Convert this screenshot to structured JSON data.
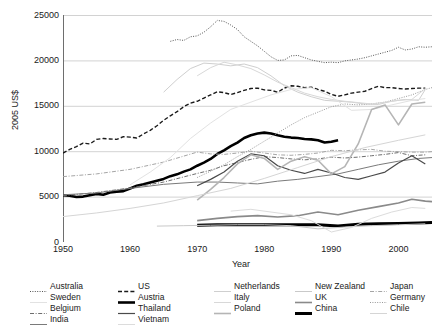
{
  "title_remnant": "",
  "axes": {
    "ylabel": "2005 US$",
    "xlabel": "Year",
    "yticks": [
      "0",
      "5000",
      "10000",
      "15000",
      "20000",
      "25000"
    ],
    "xticks": [
      "1950",
      "1960",
      "1970",
      "1980",
      "1990",
      "2000"
    ]
  },
  "legend": {
    "columns": [
      {
        "items": [
          {
            "label": "Australia",
            "style": "dotted",
            "color": "#555555",
            "width": 1
          },
          {
            "label": "Sweden",
            "style": "solid",
            "color": "#e2e2e2",
            "width": 1
          },
          {
            "label": "Belgium",
            "style": "dashdot",
            "color": "#6d6d6d",
            "width": 1
          },
          {
            "label": "India",
            "style": "solid",
            "color": "#7a7a7a",
            "width": 1
          }
        ]
      },
      {
        "items": [
          {
            "label": "US",
            "style": "dashed",
            "color": "#1a1a1a",
            "width": 1.4
          },
          {
            "label": "Austria",
            "style": "solid",
            "color": "#000000",
            "width": 2.6
          },
          {
            "label": "Thailand",
            "style": "solid",
            "color": "#4a4a4a",
            "width": 1.2
          },
          {
            "label": "Vietnam",
            "style": "solid",
            "color": "#dcdcdc",
            "width": 1
          }
        ]
      },
      {
        "items": [
          {
            "label": "Netherlands",
            "style": "solid",
            "color": "#cfcfcf",
            "width": 1
          },
          {
            "label": "Italy",
            "style": "solid",
            "color": "#d8d8d8",
            "width": 1
          },
          {
            "label": "Poland",
            "style": "solid",
            "color": "#b5b5b5",
            "width": 1.6
          }
        ]
      },
      {
        "items": [
          {
            "label": "New Zealand",
            "style": "solid",
            "color": "#c9c9c9",
            "width": 1
          },
          {
            "label": "UK",
            "style": "solid",
            "color": "#8a8a8a",
            "width": 1.6
          },
          {
            "label": "China",
            "style": "solid",
            "color": "#000000",
            "width": 3.0
          }
        ]
      },
      {
        "items": [
          {
            "label": "Japan",
            "style": "dashdot",
            "color": "#a5a5a5",
            "width": 1
          },
          {
            "label": "Germany",
            "style": "dotted",
            "color": "#999999",
            "width": 1
          },
          {
            "label": "Chile",
            "style": "solid",
            "color": "#d5d5d5",
            "width": 1
          }
        ]
      }
    ]
  },
  "chart_data": {
    "type": "line",
    "title": "",
    "xlabel": "Year",
    "ylabel": "2005 US$",
    "xlim": [
      1950,
      2005
    ],
    "ylim": [
      0,
      25000
    ],
    "grid": true,
    "legend_position": "bottom",
    "series": [
      {
        "name": "Australia",
        "style": "dotted",
        "color": "#555555",
        "width": 1,
        "x": [
          1966,
          1967,
          1968,
          1969,
          1970,
          1971,
          1972,
          1973,
          1974,
          1975,
          1976,
          1977,
          1978,
          1979,
          1980,
          1981,
          1982,
          1983,
          1984,
          1985,
          1986,
          1987,
          1988,
          1989,
          1990,
          1991,
          1992,
          1993,
          1994,
          1995,
          1996,
          1997,
          1998,
          1999,
          2000,
          2001,
          2002,
          2003,
          2004,
          2005
        ],
        "y": [
          22100,
          22300,
          22200,
          22600,
          22700,
          23100,
          23700,
          24400,
          24300,
          23900,
          23400,
          22600,
          22100,
          21600,
          21000,
          20400,
          20000,
          20050,
          20500,
          20550,
          20300,
          20050,
          19900,
          19750,
          19800,
          19750,
          19950,
          20050,
          20150,
          20300,
          20500,
          20700,
          20900,
          21100,
          21450,
          21150,
          21250,
          21500,
          21450,
          21500
        ]
      },
      {
        "name": "US",
        "style": "dashed",
        "color": "#1a1a1a",
        "width": 1.4,
        "x": [
          1950,
          1951,
          1952,
          1953,
          1954,
          1955,
          1956,
          1957,
          1958,
          1959,
          1960,
          1961,
          1962,
          1963,
          1964,
          1965,
          1966,
          1967,
          1968,
          1969,
          1970,
          1971,
          1972,
          1973,
          1974,
          1975,
          1976,
          1977,
          1978,
          1979,
          1980,
          1981,
          1982,
          1983,
          1984,
          1985,
          1986,
          1987,
          1988,
          1989,
          1990,
          1991,
          1992,
          1993,
          1994,
          1995,
          1996,
          1997,
          1998,
          1999,
          2000,
          2001,
          2002,
          2003,
          2004
        ],
        "y": [
          9800,
          10200,
          10500,
          10900,
          10800,
          11300,
          11400,
          11350,
          11300,
          11600,
          11550,
          11450,
          11900,
          12300,
          12800,
          13400,
          13900,
          14350,
          14900,
          15300,
          15500,
          15850,
          16200,
          16550,
          16450,
          16250,
          16450,
          16700,
          16900,
          16950,
          16750,
          16700,
          16500,
          16950,
          17200,
          17150,
          17000,
          17050,
          16800,
          16600,
          16250,
          16050,
          16200,
          16400,
          16500,
          16600,
          16900,
          17150,
          17000,
          17000,
          16900,
          16850,
          16900,
          16950,
          16950
        ]
      },
      {
        "name": "Austria",
        "style": "solid",
        "color": "#000000",
        "width": 2.6,
        "x": [
          1950,
          1951,
          1952,
          1953,
          1954,
          1955,
          1956,
          1957,
          1958,
          1959,
          1960,
          1961,
          1962,
          1963,
          1964,
          1965,
          1966,
          1967,
          1968,
          1969,
          1970,
          1971,
          1972,
          1973,
          1974,
          1975,
          1976,
          1977,
          1978,
          1979,
          1980,
          1981,
          1982,
          1983,
          1984,
          1985,
          1986,
          1987,
          1988,
          1989,
          1990,
          1991
        ],
        "y": [
          5150,
          5100,
          4950,
          5000,
          5150,
          5300,
          5200,
          5450,
          5550,
          5600,
          5900,
          6200,
          6350,
          6550,
          6750,
          6950,
          7250,
          7450,
          7750,
          8000,
          8400,
          8750,
          9150,
          9700,
          10100,
          10550,
          10950,
          11450,
          11750,
          11950,
          12050,
          11950,
          11750,
          11600,
          11500,
          11450,
          11350,
          11300,
          11200,
          10950,
          11050,
          11200
        ]
      },
      {
        "name": "Belgium",
        "style": "dashdot",
        "color": "#6d6d6d",
        "width": 1,
        "x": [
          1950,
          1955,
          1960,
          1965,
          1970,
          1972,
          1974,
          1976,
          1978,
          1980,
          1982,
          1984,
          1986,
          1988,
          1990,
          1992,
          1994,
          1996,
          1998,
          2000,
          2002,
          2004
        ],
        "y": [
          5100,
          5450,
          5950,
          6600,
          7550,
          7900,
          8400,
          8750,
          9100,
          9400,
          9300,
          9150,
          9050,
          9150,
          9350,
          9250,
          9350,
          9500,
          9650,
          9850,
          9500,
          9600
        ]
      },
      {
        "name": "Japan",
        "style": "dashdot",
        "color": "#a5a5a5",
        "width": 1,
        "x": [
          1950,
          1955,
          1960,
          1965,
          1970,
          1972,
          1974,
          1976,
          1978,
          1980,
          1982,
          1984,
          1986,
          1988,
          1990,
          1992,
          1994,
          1996,
          1998,
          2000,
          2002,
          2004,
          2005
        ],
        "y": [
          7200,
          7500,
          8000,
          8800,
          9900,
          9700,
          9650,
          9800,
          10000,
          9800,
          9600,
          9550,
          9650,
          9800,
          10100,
          10050,
          10150,
          10200,
          10000,
          9950,
          9900,
          9900,
          9950
        ]
      },
      {
        "name": "Germany",
        "style": "dotted",
        "color": "#999999",
        "width": 1,
        "x": [
          1970,
          1972,
          1974,
          1976,
          1978,
          1980,
          1982,
          1984,
          1986,
          1988,
          1990,
          1992,
          1994,
          1996,
          1998,
          2000,
          2002,
          2004,
          2005
        ],
        "y": [
          7100,
          7800,
          8500,
          9400,
          10200,
          11100,
          12000,
          12900,
          13700,
          14300,
          14900,
          15200,
          15100,
          15200,
          15400,
          15800,
          16200,
          16800,
          17000
        ]
      },
      {
        "name": "Netherlands",
        "style": "solid",
        "color": "#cfcfcf",
        "width": 1,
        "x": [
          1965,
          1967,
          1969,
          1971,
          1973,
          1975,
          1977,
          1979,
          1981,
          1983,
          1985,
          1987,
          1989,
          1991,
          1993,
          1995,
          1997,
          1999,
          2001,
          2003,
          2004
        ],
        "y": [
          16500,
          17900,
          19100,
          19700,
          19600,
          19400,
          19600,
          19200,
          18300,
          17200,
          16500,
          16000,
          15600,
          15500,
          15400,
          15200,
          15150,
          15500,
          15700,
          15600,
          16800
        ]
      },
      {
        "name": "Italy",
        "style": "solid",
        "color": "#d8d8d8",
        "width": 1,
        "x": [
          1970,
          1972,
          1974,
          1976,
          1978,
          1980,
          1982,
          1984,
          1986,
          1988,
          1990,
          1992,
          1994,
          1996,
          1998,
          2000,
          2002,
          2004
        ],
        "y": [
          18300,
          19200,
          19800,
          19500,
          19100,
          18400,
          17600,
          17000,
          16400,
          16000,
          15700,
          15500,
          15350,
          15200,
          15400,
          15600,
          15700,
          16900
        ]
      },
      {
        "name": "Sweden",
        "style": "solid",
        "color": "#e2e2e2",
        "width": 1,
        "x": [
          1960,
          1963,
          1966,
          1969,
          1972,
          1975,
          1978,
          1981,
          1984,
          1987,
          1990,
          1993,
          1996,
          1999,
          2002,
          2004
        ],
        "y": [
          6300,
          7700,
          9300,
          11400,
          13100,
          14600,
          15400,
          16200,
          16800,
          17000,
          16000,
          14500,
          14600,
          15100,
          15600,
          15800
        ]
      },
      {
        "name": "India",
        "style": "solid",
        "color": "#7a7a7a",
        "width": 1,
        "x": [
          1950,
          1955,
          1960,
          1965,
          1970,
          1973,
          1976,
          1979,
          1982,
          1985,
          1988,
          1991,
          1994,
          1997,
          2000,
          2003,
          2005
        ],
        "y": [
          5200,
          5400,
          5900,
          6350,
          6600,
          6600,
          6500,
          6400,
          6700,
          6900,
          7200,
          7500,
          8000,
          8500,
          8900,
          9200,
          9300
        ]
      },
      {
        "name": "Thailand",
        "style": "solid",
        "color": "#4a4a4a",
        "width": 1.2,
        "x": [
          1970,
          1972,
          1974,
          1976,
          1978,
          1980,
          1982,
          1984,
          1986,
          1988,
          1990,
          1992,
          1994,
          1996,
          1998,
          2000,
          2002,
          2004
        ],
        "y": [
          6200,
          6900,
          7700,
          8900,
          9700,
          9500,
          8400,
          7900,
          7550,
          8000,
          7600,
          7100,
          6900,
          7300,
          7700,
          8700,
          9500,
          8600
        ]
      },
      {
        "name": "Poland",
        "style": "solid",
        "color": "#b5b5b5",
        "width": 1.6,
        "x": [
          1970,
          1972,
          1974,
          1976,
          1978,
          1980,
          1982,
          1984,
          1986,
          1988,
          1990,
          1992,
          1994,
          1996,
          1998,
          2000,
          2002,
          2004
        ],
        "y": [
          4600,
          5800,
          7100,
          8600,
          9600,
          9200,
          8000,
          8900,
          9400,
          9000,
          7500,
          8300,
          10800,
          14600,
          15100,
          12900,
          15200,
          15400
        ]
      },
      {
        "name": "UK",
        "style": "solid",
        "color": "#8a8a8a",
        "width": 1.6,
        "x": [
          1970,
          1973,
          1976,
          1979,
          1982,
          1985,
          1988,
          1991,
          1994,
          1997,
          2000,
          2002,
          2004,
          2005
        ],
        "y": [
          2350,
          2600,
          2800,
          2900,
          2750,
          2900,
          3300,
          3000,
          3500,
          3900,
          4300,
          4700,
          4500,
          4450
        ]
      },
      {
        "name": "China",
        "style": "solid",
        "color": "#000000",
        "width": 3.0,
        "x": [
          1970,
          1973,
          1976,
          1979,
          1982,
          1985,
          1988,
          1991,
          1994,
          1997,
          2000,
          2003,
          2005
        ],
        "y": [
          1850,
          1900,
          1900,
          1900,
          1900,
          1900,
          1900,
          1750,
          1950,
          2000,
          2050,
          2100,
          2150
        ]
      },
      {
        "name": "New Zealand",
        "style": "solid",
        "color": "#c9c9c9",
        "width": 1,
        "x": [
          1964,
          1968,
          1972,
          1976,
          1980,
          1984,
          1988,
          1992,
          1996,
          2000,
          2004
        ],
        "y": [
          1750,
          1800,
          1850,
          1900,
          1900,
          1800,
          1450,
          1650,
          1800,
          1900,
          2000
        ]
      },
      {
        "name": "Vietnam",
        "style": "solid",
        "color": "#dcdcdc",
        "width": 1,
        "x": [
          1975,
          1978,
          1981,
          1984,
          1987,
          1990,
          1993,
          1996,
          1999,
          2002,
          2004
        ],
        "y": [
          3400,
          3600,
          3300,
          3000,
          2350,
          1100,
          1600,
          2600,
          3300,
          3800,
          3700
        ]
      },
      {
        "name": "Chile",
        "style": "solid",
        "color": "#d5d5d5",
        "width": 1,
        "x": [
          1950,
          1955,
          1960,
          1965,
          1970,
          1975,
          1980,
          1985,
          1990,
          1995,
          2000,
          2004
        ],
        "y": [
          2800,
          3200,
          3700,
          4300,
          5100,
          5900,
          7000,
          8200,
          9400,
          10400,
          11200,
          11800
        ]
      }
    ]
  }
}
